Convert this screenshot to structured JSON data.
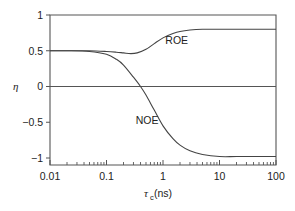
{
  "chart_data": {
    "type": "line",
    "title": "",
    "xlabel": "τc (ns)",
    "xlabel_parts": {
      "symbol": "τ",
      "subscript": "c",
      "unit": " (ns)"
    },
    "ylabel": "η",
    "xscale": "log",
    "xlim": [
      0.01,
      100
    ],
    "ylim": [
      -1,
      1
    ],
    "xticks": [
      0.01,
      0.1,
      1,
      10,
      100
    ],
    "xtick_labels": [
      "0.01",
      "0.1",
      "1",
      "10",
      "100"
    ],
    "yticks": [
      1,
      0.5,
      0,
      -0.5,
      -1
    ],
    "ytick_labels": [
      "1",
      "0.5",
      "0",
      "−0.5",
      "−1"
    ],
    "grid": false,
    "reference_lines": [
      0
    ],
    "legend": "inline labels",
    "series": [
      {
        "name": "ROE",
        "x": [
          0.01,
          0.02,
          0.05,
          0.1,
          0.15,
          0.2,
          0.27,
          0.35,
          0.5,
          0.7,
          1,
          1.5,
          2,
          3,
          5,
          10,
          20,
          50,
          100
        ],
        "values": [
          0.5,
          0.5,
          0.5,
          0.49,
          0.48,
          0.47,
          0.46,
          0.47,
          0.52,
          0.6,
          0.68,
          0.74,
          0.77,
          0.79,
          0.8,
          0.8,
          0.8,
          0.8,
          0.8
        ]
      },
      {
        "name": "NOE",
        "x": [
          0.01,
          0.02,
          0.05,
          0.1,
          0.15,
          0.2,
          0.3,
          0.4,
          0.5,
          0.7,
          1,
          1.5,
          2,
          3,
          5,
          10,
          20,
          50,
          100
        ],
        "values": [
          0.5,
          0.5,
          0.49,
          0.45,
          0.38,
          0.3,
          0.13,
          0.0,
          -0.12,
          -0.33,
          -0.55,
          -0.73,
          -0.82,
          -0.9,
          -0.95,
          -0.98,
          -0.98,
          -0.98,
          -0.98
        ]
      }
    ],
    "annotations": [
      {
        "text": "ROE",
        "x": 1.1,
        "y": 0.6
      },
      {
        "text": "NOE",
        "x": 0.33,
        "y": -0.52
      }
    ]
  },
  "axes": {
    "y_label": "η",
    "x_label_symbol": "τ",
    "x_label_subscript": "c",
    "x_label_unit": " (ns)"
  }
}
